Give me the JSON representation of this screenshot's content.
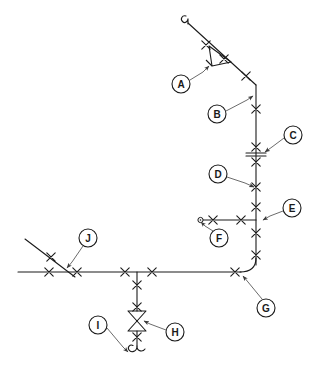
{
  "diagram": {
    "type": "piping-isometric",
    "background_color": "#ffffff",
    "line_color": "#1a1a1a",
    "leader_color": "#5a5a5a",
    "canvas": {
      "width": 320,
      "height": 380
    }
  },
  "balloons": [
    {
      "id": "A",
      "label": "A",
      "cx": 181,
      "cy": 84,
      "r": 9,
      "leader": "M190,80 L203,72 L209,66",
      "arrow_at": [
        209,
        66
      ],
      "target": "check-valve-arrow-symbol"
    },
    {
      "id": "B",
      "label": "B",
      "cx": 217,
      "cy": 114,
      "r": 9,
      "leader": "M226,111 L247,100 L253,96",
      "arrow_at": [
        253,
        96
      ],
      "target": "pipe-bend-upper"
    },
    {
      "id": "C",
      "label": "C",
      "cx": 293,
      "cy": 135,
      "r": 9,
      "leader": "M284,138 L272,147 L265,152",
      "arrow_at": [
        265,
        152
      ],
      "target": "flanged-joint"
    },
    {
      "id": "D",
      "label": "D",
      "cx": 218,
      "cy": 174,
      "r": 9,
      "leader": "M227,177 L245,183 L254,187",
      "arrow_at": [
        254,
        187
      ],
      "target": "weld-joint-vertical"
    },
    {
      "id": "E",
      "label": "E",
      "cx": 292,
      "cy": 208,
      "r": 9,
      "leader": "M283,211 L270,216 L263,220",
      "arrow_at": [
        263,
        220
      ],
      "target": "branch-tee-connection"
    },
    {
      "id": "F",
      "label": "F",
      "cx": 219,
      "cy": 238,
      "r": 9,
      "leader": "M213,231 L205,226 L201,222",
      "arrow_at": [
        201,
        222
      ],
      "target": "open-end-cap"
    },
    {
      "id": "G",
      "label": "G",
      "cx": 266,
      "cy": 308,
      "r": 9,
      "leader": "M262,299 L248,282 L243,276",
      "arrow_at": [
        243,
        276
      ],
      "target": "pipe-elbow-lower-right"
    },
    {
      "id": "H",
      "label": "H",
      "cx": 175,
      "cy": 332,
      "r": 9,
      "leader": "M166,330 L150,324 L144,321",
      "arrow_at": [
        144,
        321
      ],
      "target": "gate-valve-bowtie"
    },
    {
      "id": "I",
      "label": "I",
      "cx": 98,
      "cy": 325,
      "r": 9,
      "leader": "M107,328 L123,347 L128,352",
      "arrow_at": [
        128,
        352
      ],
      "target": "drain-hook-end"
    },
    {
      "id": "J",
      "label": "J",
      "cx": 88,
      "cy": 238,
      "r": 9,
      "leader": "M83,246 L72,262 L67,268",
      "arrow_at": [
        67,
        268
      ],
      "target": "branch-line-junction"
    }
  ],
  "components": {
    "check_valve_symbol": "arrow-triangle",
    "gate_valve_symbol": "bowtie-double-triangle",
    "flange_symbol": "double-weld-with-bars",
    "end_cap_symbol": "open-circle",
    "terminal_symbol": "hook-end",
    "weld_symbol": "x-mark"
  },
  "weld_marks": [
    {
      "x": 206,
      "y": 45
    },
    {
      "x": 224,
      "y": 59
    },
    {
      "x": 246,
      "y": 76
    },
    {
      "x": 256,
      "y": 109
    },
    {
      "x": 256,
      "y": 147
    },
    {
      "x": 256,
      "y": 162
    },
    {
      "x": 256,
      "y": 187
    },
    {
      "x": 256,
      "y": 207
    },
    {
      "x": 256,
      "y": 233
    },
    {
      "x": 256,
      "y": 255
    },
    {
      "x": 235,
      "y": 272
    },
    {
      "x": 241,
      "y": 220
    },
    {
      "x": 213,
      "y": 220
    },
    {
      "x": 152,
      "y": 272
    },
    {
      "x": 125,
      "y": 272
    },
    {
      "x": 77,
      "y": 272
    },
    {
      "x": 49,
      "y": 272
    },
    {
      "x": 51,
      "y": 257
    },
    {
      "x": 137,
      "y": 285
    },
    {
      "x": 137,
      "y": 307
    },
    {
      "x": 137,
      "y": 337
    }
  ]
}
